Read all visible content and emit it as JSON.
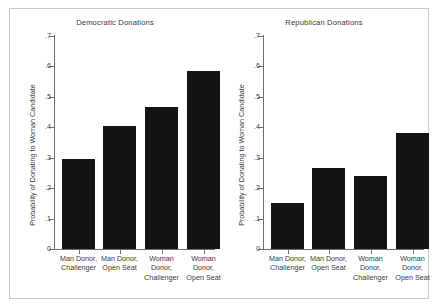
{
  "chart_data": [
    {
      "type": "bar",
      "title": "Democratic Donations",
      "xlabel": "",
      "ylabel": "Probability of Donating to Woman Candidate",
      "categories": [
        "Man Donor,\nChallenger",
        "Man Donor,\nOpen Seat",
        "Woman\nDonor,\nChallenger",
        "Woman\nDonor,\nOpen Seat"
      ],
      "values": [
        0.295,
        0.405,
        0.468,
        0.585
      ],
      "ylim": [
        0,
        0.7
      ],
      "yticks": [
        0,
        0.1,
        0.2,
        0.3,
        0.4,
        0.5,
        0.6,
        0.7
      ],
      "ytick_labels": [
        "0",
        ".1",
        ".2",
        ".3",
        ".4",
        ".5",
        ".6",
        ".7"
      ],
      "grid": false,
      "legend": "none",
      "bar_color": "#141414"
    },
    {
      "type": "bar",
      "title": "Republican Donations",
      "xlabel": "",
      "ylabel": "Probability of Donating to Woman Candidate",
      "categories": [
        "Man Donor,\nChallenger",
        "Man Donor,\nOpen Seat",
        "Woman\nDonor,\nChallenger",
        "Woman\nDonor,\nOpen Seat"
      ],
      "values": [
        0.152,
        0.266,
        0.241,
        0.381
      ],
      "ylim": [
        0,
        0.7
      ],
      "yticks": [
        0,
        0.1,
        0.2,
        0.3,
        0.4,
        0.5,
        0.6,
        0.7
      ],
      "ytick_labels": [
        "0",
        ".1",
        ".2",
        ".3",
        ".4",
        ".5",
        ".6",
        ".7"
      ],
      "grid": false,
      "legend": "none",
      "bar_color": "#141414"
    }
  ],
  "figure": {
    "background": "#ffffff",
    "frame_color": "#c9c9c9",
    "axis_color": "#6f6f6f",
    "text_color": "#3a3a3a"
  }
}
